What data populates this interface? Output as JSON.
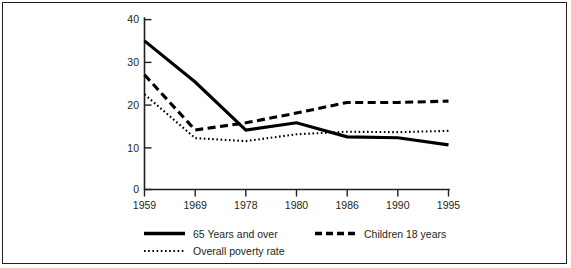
{
  "chart_data": {
    "type": "line",
    "title": "",
    "xlabel": "",
    "ylabel": "",
    "categories": [
      "1959",
      "1969",
      "1978",
      "1980",
      "1986",
      "1990",
      "1995"
    ],
    "x_tick_labels": [
      "1959",
      "1969",
      "1978",
      "1980",
      "1986",
      "1990",
      "1995"
    ],
    "y_tick_labels": [
      "0",
      "10",
      "20",
      "30",
      "40"
    ],
    "y_ticks": [
      0,
      10,
      20,
      30,
      40
    ],
    "ylim": [
      0,
      40
    ],
    "grid": false,
    "legend_position": "bottom",
    "series": [
      {
        "name": "65 Years and over",
        "style": "solid",
        "color": "#000000",
        "values": [
          35.0,
          25.3,
          14.0,
          15.7,
          12.4,
          12.2,
          10.5
        ]
      },
      {
        "name": "Children 18 years",
        "style": "dashed",
        "color": "#000000",
        "values": [
          27.0,
          14.0,
          15.7,
          18.0,
          20.5,
          20.5,
          20.8
        ]
      },
      {
        "name": "Overall poverty rate",
        "style": "dotted",
        "color": "#000000",
        "values": [
          22.4,
          12.1,
          11.4,
          13.0,
          13.6,
          13.5,
          13.8
        ]
      }
    ]
  },
  "axis": {
    "y_label_40": "40",
    "y_label_30": "30",
    "y_label_20": "20",
    "y_label_10": "10",
    "y_label_0": "0",
    "x_label_1": "1959",
    "x_label_2": "1969",
    "x_label_3": "1978",
    "x_label_4": "1980",
    "x_label_5": "1986",
    "x_label_6": "1990",
    "x_label_7": "1995"
  },
  "legend": {
    "entry_solid": "65 Years and over",
    "entry_dashed": "Children 18 years",
    "entry_dotted": "Overall poverty rate"
  }
}
